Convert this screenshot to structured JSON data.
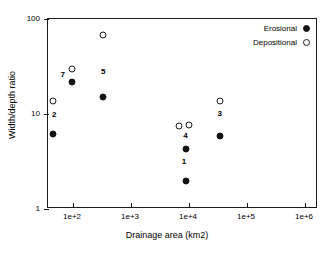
{
  "chart_data": {
    "type": "scatter",
    "title": "",
    "xlabel": "Drainage area (km2)",
    "ylabel": "Width/depth ratio",
    "xscale": "log",
    "yscale": "log",
    "xlim": [
      60,
      1000000
    ],
    "ylim": [
      1,
      100
    ],
    "grid": false,
    "legend_position": "top-right",
    "xticks": [
      "1e+2",
      "1e+3",
      "1e+4",
      "1e+5",
      "1e+6"
    ],
    "xtick_values": [
      100,
      1000,
      10000,
      100000,
      1000000
    ],
    "yticks": [
      "100",
      "10",
      "1"
    ],
    "ytick_values": [
      100,
      10,
      1
    ],
    "series": [
      {
        "name": "Erosional",
        "marker": "filled-circle",
        "color": "#121212",
        "points": [
          {
            "x": 72,
            "y": 6.1,
            "site": "2"
          },
          {
            "x": 140,
            "y": 21.5,
            "site": "7"
          },
          {
            "x": 440,
            "y": 15.0,
            "site": "5"
          },
          {
            "x": 8700,
            "y": 4.3,
            "site": "4"
          },
          {
            "x": 8500,
            "y": 1.95,
            "site": "1"
          },
          {
            "x": 29000,
            "y": 5.9,
            "site": "3"
          }
        ]
      },
      {
        "name": "Depositional",
        "marker": "open-circle",
        "color": "#ffffff",
        "points": [
          {
            "x": 72,
            "y": 13.7,
            "site": "2"
          },
          {
            "x": 140,
            "y": 30.0,
            "site": "7"
          },
          {
            "x": 440,
            "y": 68.0,
            "site": "5"
          },
          {
            "x": 6700,
            "y": 7.4,
            "site": "1"
          },
          {
            "x": 9500,
            "y": 7.7,
            "site": "4"
          },
          {
            "x": 29000,
            "y": 13.6,
            "site": "3"
          }
        ]
      }
    ],
    "point_labels": [
      {
        "text": "2",
        "x": 75,
        "y": 9.8
      },
      {
        "text": "7",
        "x": 102,
        "y": 25.5
      },
      {
        "text": "5",
        "x": 440,
        "y": 28.0
      },
      {
        "text": "4",
        "x": 8500,
        "y": 5.8
      },
      {
        "text": "1",
        "x": 8000,
        "y": 3.1
      },
      {
        "text": "3",
        "x": 29000,
        "y": 9.9
      }
    ]
  },
  "legend": {
    "entries": [
      {
        "label": "Erosional",
        "marker": "filled-circle"
      },
      {
        "label": "Depositional",
        "marker": "open-circle"
      }
    ]
  },
  "axes": {
    "x": {
      "label": "Drainage area (km2)",
      "ticks": [
        {
          "label": "1e+2",
          "pos": 72
        },
        {
          "label": "1e+3",
          "pos": 130
        },
        {
          "label": "1e+4",
          "pos": 188
        },
        {
          "label": "1e+5",
          "pos": 246
        },
        {
          "label": "1e+6",
          "pos": 304
        }
      ]
    },
    "y": {
      "label": "Width/depth ratio",
      "ticks": [
        {
          "label": "100",
          "pos": 18
        },
        {
          "label": "10",
          "pos": 113
        },
        {
          "label": "1",
          "pos": 208
        }
      ]
    }
  }
}
